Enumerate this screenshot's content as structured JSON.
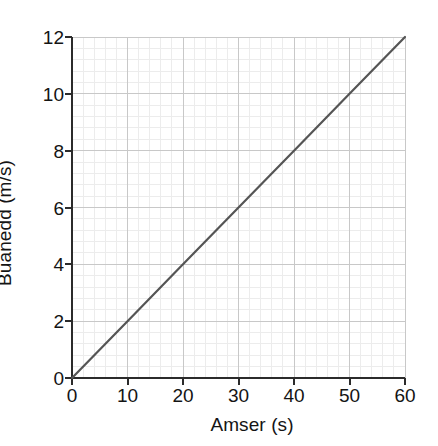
{
  "chart_data": {
    "type": "line",
    "title": "",
    "subtitle": "",
    "xlabel": "Amser (s)",
    "ylabel": "Buanedd (m/s)",
    "xlim": [
      0,
      60
    ],
    "ylim": [
      0,
      12
    ],
    "xticks": [
      0,
      10,
      20,
      30,
      40,
      50,
      60
    ],
    "yticks": [
      0,
      2,
      4,
      6,
      8,
      10,
      12
    ],
    "xtick_labels": [
      "0",
      "10",
      "20",
      "30",
      "40",
      "50",
      "60"
    ],
    "ytick_labels": [
      "0",
      "2",
      "4",
      "6",
      "8",
      "10",
      "12"
    ],
    "x_minor_interval": 2,
    "y_minor_interval": 0.4,
    "grid": true,
    "grid_major": true,
    "grid_minor": true,
    "legend": null,
    "legend_position": "none",
    "annotations": [],
    "series": [
      {
        "name": "",
        "x": [
          0,
          10,
          20,
          30,
          40,
          50,
          60
        ],
        "values": [
          0,
          2,
          4,
          6,
          8,
          10,
          12
        ],
        "slope": 0.2,
        "intercept": 0,
        "color": "#555555",
        "linewidth": 2.2,
        "marker": "none"
      }
    ],
    "colors": {
      "background": "#ffffff",
      "axis": "#2b2b2b",
      "tick_label": "#141414",
      "grid_major": "#c8c8c8",
      "grid_minor": "#ececec",
      "line": "#555555"
    }
  }
}
